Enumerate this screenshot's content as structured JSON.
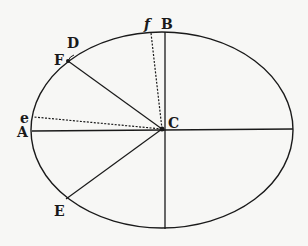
{
  "diagram": {
    "type": "geometric-ellipse",
    "ellipse": {
      "cx": 162,
      "cy": 130,
      "rx": 131,
      "ry": 98
    },
    "center": {
      "label": "C",
      "x": 162,
      "y": 129
    },
    "points": {
      "A": {
        "label": "A",
        "x": 32,
        "y": 130
      },
      "B": {
        "label": "B",
        "x": 165,
        "y": 32
      },
      "D": {
        "label": "D",
        "x": 73,
        "y": 56
      },
      "F": {
        "label": "F",
        "x": 68,
        "y": 61
      },
      "E": {
        "label": "E",
        "x": 66,
        "y": 199
      },
      "e": {
        "label": "e",
        "x": 34,
        "y": 116
      },
      "f": {
        "label": "f",
        "x": 151,
        "y": 32
      }
    },
    "labels": {
      "A": "A",
      "B": "B",
      "C": "C",
      "D": "D",
      "E": "E",
      "F": "F",
      "e": "e",
      "f": "f"
    },
    "solid_lines": [
      "C-A (major semi-axis left)",
      "C-right (major semi-axis right)",
      "C-B (minor semi-axis top)",
      "C-bottom (minor semi-axis bottom)",
      "C-F",
      "C-E"
    ],
    "dashed_lines": [
      "C-e",
      "C-f"
    ],
    "colors": {
      "ink": "#1a1a1a",
      "paper": "#f7f7f5"
    }
  }
}
